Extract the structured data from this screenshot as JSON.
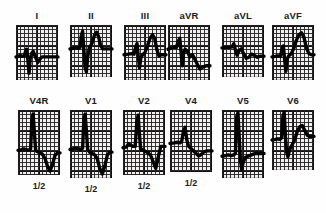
{
  "figure": {
    "kind": "12-lead-ecg-strip-panel",
    "rows": 2,
    "columns": 6,
    "paper_color": "#f4f0f0",
    "grid_color": "#282828",
    "trace_color": "#000000"
  },
  "leads": [
    {
      "id": "I",
      "label": "I",
      "scale_label": "",
      "row": 0,
      "col": 0,
      "x": 16,
      "y": 25,
      "w": 42,
      "h": 55,
      "baseline_pct": 58,
      "trace": "M0,58 L6,57 L10,55 L14,57 L20,56 L22,50 L25,44 L28,62 L31,88 L34,60 L37,52 L41,48 L46,58 L52,68 L57,62 L62,58 L72,58 L84,58 L100,58"
    },
    {
      "id": "II",
      "label": "II",
      "scale_label": "",
      "row": 0,
      "col": 1,
      "x": 70,
      "y": 25,
      "w": 42,
      "h": 52,
      "baseline_pct": 46,
      "trace": "M0,46 L8,45 L14,44 L20,45 L24,43 L27,20 L30,12 L33,48 L36,82 L39,90 L42,62 L46,44 L52,36 L58,20 L63,14 L68,22 L73,40 L78,46 L86,46 L100,46"
    },
    {
      "id": "III",
      "label": "III",
      "scale_label": "",
      "row": 0,
      "col": 2,
      "x": 124,
      "y": 25,
      "w": 42,
      "h": 55,
      "baseline_pct": 54,
      "trace": "M0,54 L10,53 L18,52 L24,53 L28,40 L31,34 L34,58 L37,78 L40,60 L44,54 L50,50 L56,38 L62,24 L68,18 L73,24 L78,44 L83,56 L90,54 L100,54"
    },
    {
      "id": "aVR",
      "label": "aVR",
      "scale_label": "",
      "row": 0,
      "col": 3,
      "x": 168,
      "y": 25,
      "w": 42,
      "h": 55,
      "baseline_pct": 42,
      "trace": "M0,44 L8,42 L14,40 L20,41 L24,30 L28,24 L31,48 L34,74 L37,52 L41,44 L46,48 L52,58 L58,54 L64,62 L70,72 L76,80 L84,76 L92,74 L100,74"
    },
    {
      "id": "aVL",
      "label": "aVL",
      "scale_label": "",
      "row": 0,
      "col": 4,
      "x": 222,
      "y": 25,
      "w": 42,
      "h": 52,
      "baseline_pct": 44,
      "trace": "M0,44 L10,43 L18,43 L24,42 L28,36 L32,48 L36,58 L40,50 L46,46 L52,56 L58,64 L64,62 L70,56 L76,58 L84,62 L92,60 L100,60"
    },
    {
      "id": "aVF",
      "label": "aVF",
      "scale_label": "",
      "row": 0,
      "col": 5,
      "x": 272,
      "y": 25,
      "w": 42,
      "h": 55,
      "baseline_pct": 56,
      "trace": "M0,58 L8,57 L14,56 L20,57 L24,44 L27,38 L30,62 L33,84 L36,62 L40,56 L46,52 L52,42 L58,28 L64,18 L70,14 L76,22 L82,42 L88,52 L94,54 L100,54"
    },
    {
      "id": "V4R",
      "label": "V4R",
      "scale_label": "1/2",
      "row": 1,
      "col": 0,
      "x": 18,
      "y": 110,
      "w": 42,
      "h": 65,
      "baseline_pct": 62,
      "trace": "M0,62 L8,61 L14,60 L20,61 L26,62 L30,60 L33,16 L36,6 L39,34 L42,62 L46,64 L52,66 L58,68 L64,74 L70,86 L76,94 L82,84 L88,70 L94,66 L100,66"
    },
    {
      "id": "V1",
      "label": "V1",
      "scale_label": "1/2",
      "row": 1,
      "col": 1,
      "x": 70,
      "y": 110,
      "w": 42,
      "h": 68,
      "baseline_pct": 58,
      "trace": "M0,58 L8,57 L14,56 L20,57 L26,58 L30,56 L33,14 L36,6 L39,30 L42,58 L47,62 L53,64 L59,66 L65,72 L71,86 L77,94 L83,82 L89,66 L95,62 L100,62"
    },
    {
      "id": "V2",
      "label": "V2",
      "scale_label": "1/2",
      "row": 1,
      "col": 2,
      "x": 123,
      "y": 110,
      "w": 42,
      "h": 65,
      "baseline_pct": 58,
      "trace": "M0,58 L8,57 L13,52 L18,54 L24,56 L29,56 L33,18 L36,8 L39,36 L42,60 L48,62 L54,64 L60,66 L66,70 L72,80 L78,90 L84,72 L90,56 L96,56 L100,56"
    },
    {
      "id": "V4",
      "label": "V4",
      "scale_label": "1/2",
      "row": 1,
      "col": 3,
      "x": 170,
      "y": 110,
      "w": 42,
      "h": 62,
      "baseline_pct": 54,
      "trace": "M0,54 L10,53 L18,52 L24,53 L28,50 L32,34 L36,28 L40,48 L44,58 L50,62 L56,66 L62,70 L68,74 L74,72 L80,68 L88,66 L94,66 L100,66"
    },
    {
      "id": "V5",
      "label": "V5",
      "scale_label": "",
      "row": 1,
      "col": 4,
      "x": 222,
      "y": 110,
      "w": 42,
      "h": 68,
      "baseline_pct": 66,
      "trace": "M0,68 L8,67 L15,66 L22,67 L28,66 L32,64 L35,10 L38,4 L41,40 L44,74 L47,88 L50,78 L55,70 L62,68 L70,66 L78,64 L86,64 L94,64 L100,64"
    },
    {
      "id": "V6",
      "label": "V6",
      "scale_label": "",
      "row": 1,
      "col": 5,
      "x": 272,
      "y": 110,
      "w": 42,
      "h": 60,
      "baseline_pct": 48,
      "trace": "M0,50 L8,49 L14,48 L19,49 L23,46 L26,10 L29,4 L32,44 L35,70 L38,78 L42,66 L48,58 L54,50 L60,36 L66,28 L72,26 L78,34 L84,42 L90,44 L100,44"
    }
  ],
  "labels": {
    "row1_label_y": 10,
    "row2_label_y": 95
  }
}
